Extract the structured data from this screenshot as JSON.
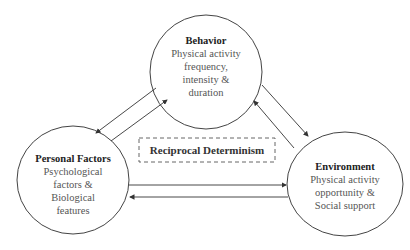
{
  "nodes": {
    "behavior": {
      "title": "Behavior",
      "lines": [
        "Physical activity",
        "frequency,",
        "intensity &",
        "duration"
      ]
    },
    "personal": {
      "title": "Personal Factors",
      "lines": [
        "Psychological",
        "factors &",
        "Biological",
        "features"
      ]
    },
    "environment": {
      "title": "Environment",
      "lines": [
        "Physical activity",
        "opportunity &",
        "Social support"
      ]
    }
  },
  "center_label": "Reciprocal Determinism",
  "colors": {
    "stroke": "#333333",
    "text": "#555555",
    "title": "#222222"
  }
}
